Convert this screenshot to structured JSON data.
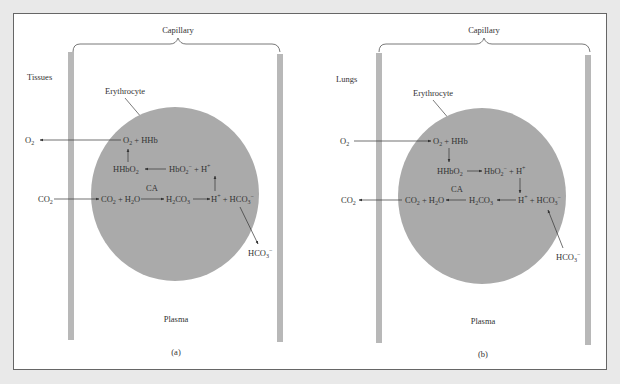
{
  "figure": {
    "colors": {
      "background": "#e9e9e9",
      "panel": "#ffffff",
      "capillary_wall": "#b8b8b8",
      "erythrocyte": "#aaaaaa",
      "text": "#333333"
    },
    "panels": [
      {
        "id": "a",
        "caption": "(a)",
        "location_label": "Tissues",
        "capillary_label": "Capillary",
        "cell_label": "Erythrocyte",
        "plasma_label": "Plasma",
        "enzyme_label": "CA",
        "external_in": "CO2",
        "external_out": "O2",
        "bicarbonate_external": "HCO3−",
        "reactions": {
          "row1": [
            "O2",
            "+",
            "HHb"
          ],
          "row2": [
            "HHbO2",
            "←",
            "HbO2−",
            "+",
            "H+"
          ],
          "row3": [
            "CO2",
            "+",
            "H2O",
            "→",
            "H2CO3",
            "→",
            "H+",
            "+",
            "HCO3−"
          ]
        }
      },
      {
        "id": "b",
        "caption": "(b)",
        "location_label": "Lungs",
        "capillary_label": "Capillary",
        "cell_label": "Erythrocyte",
        "plasma_label": "Plasma",
        "enzyme_label": "CA",
        "external_in": "O2",
        "external_out": "CO2",
        "bicarbonate_external": "HCO3−",
        "reactions": {
          "row1": [
            "O2",
            "+",
            "HHb"
          ],
          "row2": [
            "HHbO2",
            "→",
            "HbO2−",
            "+",
            "H+"
          ],
          "row3": [
            "CO2",
            "+",
            "H2O",
            "←",
            "H2CO3",
            "←",
            "H+",
            "+",
            "HCO3−"
          ]
        }
      }
    ]
  }
}
